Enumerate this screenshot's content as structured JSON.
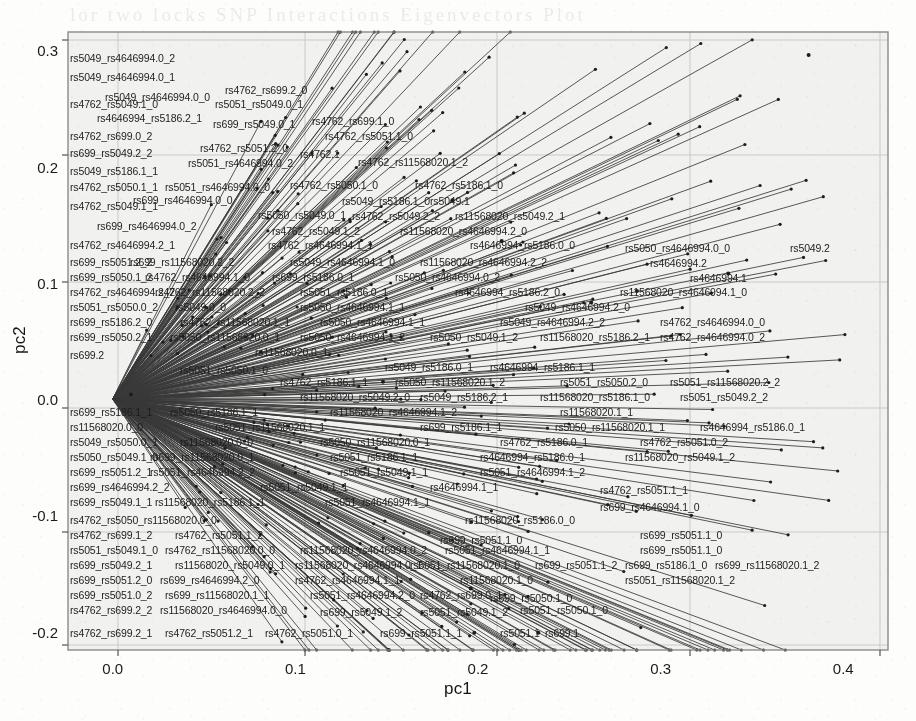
{
  "figure": {
    "kind": "pca-biplot",
    "background_hex": "#fdfdfc",
    "ink_hex": "#1d1d1d",
    "plot_area_hex": "#f2f2f0",
    "frame_hex": "#8c8c8c",
    "grid_hex": "#c8c8c6"
  },
  "chart_data": {
    "type": "scatter",
    "title": "",
    "subtitle": "",
    "xlabel": "pc1",
    "ylabel": "pc2",
    "xlim": [
      -0.0245,
      0.4245
    ],
    "ylim": [
      -0.2158,
      0.3158
    ],
    "xticks": [
      0.0,
      0.1,
      0.2,
      0.3,
      0.4
    ],
    "xticklabels": [
      "0.0",
      "0.1",
      "0.2",
      "0.3",
      "0.4"
    ],
    "yticks": [
      -0.2,
      -0.1,
      0.0,
      0.1,
      0.2,
      0.3
    ],
    "yticklabels": [
      "-0.2",
      "-0.1",
      "0.0",
      "0.1",
      "0.2",
      "0.3"
    ],
    "grid": true,
    "grid_axes": "both",
    "legend": null,
    "legend_position": "none",
    "origin": [
      0.0,
      0.0
    ],
    "marker": {
      "shape": "point",
      "size_px": 2.2,
      "color": "#1d1d1d"
    },
    "series": [
      {
        "name": "loadings",
        "marker_count": 384,
        "points": [
          {
            "label": "rs11568020.2",
            "x": 0.381,
            "y": 0.296
          },
          {
            "label": "rs5049.2",
            "x": 0.337,
            "y": 0.108
          },
          {
            "label": "rs4646994.2",
            "x": 0.287,
            "y": 0.093
          },
          {
            "label": "rs4646994.1",
            "x": 0.262,
            "y": 0.083
          },
          {
            "label": "rs4762.1",
            "x": 0.186,
            "y": 0.171
          },
          {
            "label": "rs5049.1",
            "x": 0.213,
            "y": 0.136
          },
          {
            "label": "rs5186.1_1",
            "x": 0.148,
            "y": 0.015
          },
          {
            "label": "rs5051.1",
            "x": 0.198,
            "y": -0.201
          },
          {
            "label": "rs699.1",
            "x": 0.233,
            "y": -0.201
          },
          {
            "label": "rs699.2",
            "x": 0.01,
            "y": 0.004
          },
          {
            "label": "rs5050.1_0",
            "x": 0.196,
            "y": -0.163
          }
        ]
      }
    ]
  },
  "labels": [
    {
      "t": "rs5049_rs4646994.0_2",
      "x": 70,
      "y": 58,
      "a": "start"
    },
    {
      "t": "rs5049_rs4646994.0_1",
      "x": 70,
      "y": 77,
      "a": "start"
    },
    {
      "t": "rs5049_rs4646994.0_0",
      "x": 105,
      "y": 97,
      "a": "start"
    },
    {
      "t": "rs4762_rs699.2_0",
      "x": 225,
      "y": 90,
      "a": "start"
    },
    {
      "t": "rs4762_rs5049.1_0",
      "x": 70,
      "y": 104,
      "a": "start"
    },
    {
      "t": "rs5051_rs5049.0_1",
      "x": 215,
      "y": 104,
      "a": "start"
    },
    {
      "t": "rs4646994_rs5186.2_1",
      "x": 97,
      "y": 118,
      "a": "start"
    },
    {
      "t": "rs699_rs5049.0_1",
      "x": 213,
      "y": 124,
      "a": "start"
    },
    {
      "t": "rs4762_rs699.1_0",
      "x": 312,
      "y": 121,
      "a": "start"
    },
    {
      "t": "rs4762_rs699.0_2",
      "x": 70,
      "y": 136,
      "a": "start"
    },
    {
      "t": "rs4762_rs5051.1_0",
      "x": 325,
      "y": 136,
      "a": "start"
    },
    {
      "t": "rs699_rs5049.2_2",
      "x": 70,
      "y": 153,
      "a": "start"
    },
    {
      "t": "rs4762_rs5051.2_0",
      "x": 200,
      "y": 148,
      "a": "start"
    },
    {
      "t": "rs4762.1",
      "x": 300,
      "y": 154,
      "a": "start"
    },
    {
      "t": "rs5051_rs4646994.0_2",
      "x": 188,
      "y": 163,
      "a": "start"
    },
    {
      "t": "rs4762_rs11568020.1_2",
      "x": 358,
      "y": 162,
      "a": "start"
    },
    {
      "t": "rs5049_rs5186.1_1",
      "x": 70,
      "y": 171,
      "a": "start"
    },
    {
      "t": "rs4762_rs5050.1_1",
      "x": 70,
      "y": 187,
      "a": "start"
    },
    {
      "t": "rs5051_rs4646994.0_0",
      "x": 165,
      "y": 187,
      "a": "start"
    },
    {
      "t": "rs4762_rs5050.1_0",
      "x": 290,
      "y": 185,
      "a": "start"
    },
    {
      "t": "rs4762_rs5186.1_0",
      "x": 415,
      "y": 185,
      "a": "start"
    },
    {
      "t": "rs699_rs4646994.0_0",
      "x": 133,
      "y": 200,
      "a": "start"
    },
    {
      "t": "rs5049_rs5186.1_0",
      "x": 342,
      "y": 201,
      "a": "start"
    },
    {
      "t": "rs5049.1",
      "x": 430,
      "y": 201,
      "a": "start"
    },
    {
      "t": "rs4762_rs5049.1_1",
      "x": 70,
      "y": 206,
      "a": "start"
    },
    {
      "t": "rs5050_rs5049.0_1",
      "x": 258,
      "y": 215,
      "a": "start"
    },
    {
      "t": "rs4762_rs5049.2_2",
      "x": 352,
      "y": 216,
      "a": "start"
    },
    {
      "t": "rs11568020_rs5049.2_1",
      "x": 455,
      "y": 216,
      "a": "start"
    },
    {
      "t": "rs699_rs4646994.0_2",
      "x": 97,
      "y": 226,
      "a": "start"
    },
    {
      "t": "rs4762_rs5049.1_2",
      "x": 272,
      "y": 231,
      "a": "start"
    },
    {
      "t": "rs11568020_rs4646994.2_0",
      "x": 400,
      "y": 231,
      "a": "start"
    },
    {
      "t": "rs4762_rs4646994.2_1",
      "x": 70,
      "y": 245,
      "a": "start"
    },
    {
      "t": "rs4762_rs4646994.1_1",
      "x": 268,
      "y": 245,
      "a": "start"
    },
    {
      "t": "rs4646994_rs5186.0_0",
      "x": 470,
      "y": 245,
      "a": "start"
    },
    {
      "t": "rs5050_rs4646994.0_0",
      "x": 625,
      "y": 248,
      "a": "start"
    },
    {
      "t": "rs5049.2",
      "x": 790,
      "y": 248,
      "a": "start"
    },
    {
      "t": "rs699_rs5051.2_2",
      "x": 70,
      "y": 262,
      "a": "start"
    },
    {
      "t": "rs699_rs11568020.2_2",
      "x": 130,
      "y": 262,
      "a": "start"
    },
    {
      "t": "rs5049_rs4646994.1_0",
      "x": 290,
      "y": 262,
      "a": "start"
    },
    {
      "t": "rs11568020_rs4646994.2_2",
      "x": 420,
      "y": 262,
      "a": "start"
    },
    {
      "t": "rs4646994.2",
      "x": 650,
      "y": 263,
      "a": "start"
    },
    {
      "t": "rs699_rs5050.1_2",
      "x": 70,
      "y": 277,
      "a": "start"
    },
    {
      "t": "rs4762_rs4646994.1_0",
      "x": 145,
      "y": 277,
      "a": "start"
    },
    {
      "t": "rs699_rs5186.0_1",
      "x": 272,
      "y": 277,
      "a": "start"
    },
    {
      "t": "rs5050_rs4646994.0_2",
      "x": 395,
      "y": 277,
      "a": "start"
    },
    {
      "t": "rs4646994.1",
      "x": 690,
      "y": 278,
      "a": "start"
    },
    {
      "t": "rs4762_rs4646994.2_2",
      "x": 70,
      "y": 292,
      "a": "start"
    },
    {
      "t": "rs4762_rs11568020.2_2",
      "x": 155,
      "y": 292,
      "a": "start"
    },
    {
      "t": "rs5051_rs5186.0_1",
      "x": 300,
      "y": 292,
      "a": "start"
    },
    {
      "t": "rs4646994_rs5186.2_0",
      "x": 455,
      "y": 292,
      "a": "start"
    },
    {
      "t": "rs11568020_rs4646994.1_0",
      "x": 620,
      "y": 292,
      "a": "start"
    },
    {
      "t": "rs5051_rs5050.0_2",
      "x": 70,
      "y": 307,
      "a": "start"
    },
    {
      "t": "rs5049.0_0",
      "x": 175,
      "y": 307,
      "a": "start"
    },
    {
      "t": "rs5050_rs4646994.1_1",
      "x": 300,
      "y": 307,
      "a": "start"
    },
    {
      "t": "rs5049_rs4646994.2_0",
      "x": 525,
      "y": 307,
      "a": "start"
    },
    {
      "t": "rs699_rs5186.2_0",
      "x": 70,
      "y": 322,
      "a": "start"
    },
    {
      "t": "rs4762_rs11568020.1_1",
      "x": 180,
      "y": 322,
      "a": "start"
    },
    {
      "t": "rs5050_rs4646994.1_1",
      "x": 320,
      "y": 322,
      "a": "start"
    },
    {
      "t": "rs5049_rs4646994.2_2",
      "x": 500,
      "y": 322,
      "a": "start"
    },
    {
      "t": "rs4762_rs4646994.0_0",
      "x": 660,
      "y": 322,
      "a": "start"
    },
    {
      "t": "rs699_rs5050.2_1",
      "x": 70,
      "y": 337,
      "a": "start"
    },
    {
      "t": "rs5050_rs11568020.0_1",
      "x": 170,
      "y": 337,
      "a": "start"
    },
    {
      "t": "rs5050_rs4646994.1_2",
      "x": 300,
      "y": 337,
      "a": "start"
    },
    {
      "t": "rs5050_rs5049.1_2",
      "x": 430,
      "y": 337,
      "a": "start"
    },
    {
      "t": "rs11568020_rs5186.2_1",
      "x": 540,
      "y": 337,
      "a": "start"
    },
    {
      "t": "rs4762_rs4646994.0_2",
      "x": 660,
      "y": 337,
      "a": "start"
    },
    {
      "t": "rs699.2",
      "x": 70,
      "y": 355,
      "a": "start"
    },
    {
      "t": "rs11568020.0_1",
      "x": 255,
      "y": 352,
      "a": "start"
    },
    {
      "t": "rs5049_rs5186.0_1",
      "x": 385,
      "y": 367,
      "a": "start"
    },
    {
      "t": "rs4646994_rs5186.1_1",
      "x": 490,
      "y": 367,
      "a": "start"
    },
    {
      "t": "rs5051_rs5050.1_0",
      "x": 180,
      "y": 370,
      "a": "start"
    },
    {
      "t": "rs4762_rs5186.1_1",
      "x": 280,
      "y": 382,
      "a": "start"
    },
    {
      "t": "rs5050_rs11568020.1_2",
      "x": 395,
      "y": 382,
      "a": "start"
    },
    {
      "t": "rs5051_rs5050.2_0",
      "x": 560,
      "y": 382,
      "a": "start"
    },
    {
      "t": "rs5051_rs11568020.2_2",
      "x": 670,
      "y": 382,
      "a": "start"
    },
    {
      "t": "rs11568020_rs5049.2_0",
      "x": 300,
      "y": 397,
      "a": "start"
    },
    {
      "t": "rs5049_rs5186.2_1",
      "x": 420,
      "y": 397,
      "a": "start"
    },
    {
      "t": "rs11568020_rs5186.1_0",
      "x": 540,
      "y": 397,
      "a": "start"
    },
    {
      "t": "rs5051_rs5049.2_2",
      "x": 680,
      "y": 397,
      "a": "start"
    },
    {
      "t": "rs699_rs5186.1_1",
      "x": 70,
      "y": 412,
      "a": "start"
    },
    {
      "t": "rs5050_rs5186.1_1",
      "x": 170,
      "y": 412,
      "a": "start"
    },
    {
      "t": "rs11568020_rs4646994.1_2",
      "x": 330,
      "y": 412,
      "a": "start"
    },
    {
      "t": "rs11568020.1_1",
      "x": 560,
      "y": 412,
      "a": "start"
    },
    {
      "t": "rs11568020.0_0",
      "x": 70,
      "y": 427,
      "a": "start"
    },
    {
      "t": "rs5051_rs11568020.1_1",
      "x": 215,
      "y": 427,
      "a": "start"
    },
    {
      "t": "rs699_rs5186.1_1",
      "x": 420,
      "y": 427,
      "a": "start"
    },
    {
      "t": "rs5050_rs11568020.1_1",
      "x": 555,
      "y": 427,
      "a": "start"
    },
    {
      "t": "rs4646994_rs5186.0_1",
      "x": 700,
      "y": 427,
      "a": "start"
    },
    {
      "t": "rs5049_rs5050.0_1",
      "x": 70,
      "y": 442,
      "a": "start"
    },
    {
      "t": "rs11568020.0_0",
      "x": 180,
      "y": 442,
      "a": "start"
    },
    {
      "t": "rs5050_rs11568020.0_1",
      "x": 320,
      "y": 442,
      "a": "start"
    },
    {
      "t": "rs4762_rs5186.0_1",
      "x": 500,
      "y": 442,
      "a": "start"
    },
    {
      "t": "rs4762_rs5051.0_2",
      "x": 640,
      "y": 442,
      "a": "start"
    },
    {
      "t": "rs5050_rs5049.1_0",
      "x": 70,
      "y": 457,
      "a": "start"
    },
    {
      "t": "rs699_rs11568020.0_1",
      "x": 150,
      "y": 457,
      "a": "start"
    },
    {
      "t": "rs5051_rs5186.1_1",
      "x": 330,
      "y": 457,
      "a": "start"
    },
    {
      "t": "rs4646994_rs5186.0_1",
      "x": 480,
      "y": 457,
      "a": "start"
    },
    {
      "t": "rs11568020_rs5049.1_2",
      "x": 625,
      "y": 457,
      "a": "start"
    },
    {
      "t": "rs699_rs5051.2_1",
      "x": 70,
      "y": 472,
      "a": "start"
    },
    {
      "t": "rs5051_rs4646994.2_2",
      "x": 150,
      "y": 472,
      "a": "start"
    },
    {
      "t": "rs5051_rs5049.1_1",
      "x": 340,
      "y": 472,
      "a": "start"
    },
    {
      "t": "rs5051_rs4646994.1_2",
      "x": 480,
      "y": 472,
      "a": "start"
    },
    {
      "t": "rs699_rs4646994.2_2",
      "x": 70,
      "y": 487,
      "a": "start"
    },
    {
      "t": "rs5051_rs5049.1_1",
      "x": 260,
      "y": 487,
      "a": "start"
    },
    {
      "t": "rs4646994.1_1",
      "x": 430,
      "y": 487,
      "a": "start"
    },
    {
      "t": "rs4762_rs5051.1_1",
      "x": 600,
      "y": 490,
      "a": "start"
    },
    {
      "t": "rs699_rs5049.1_1",
      "x": 70,
      "y": 502,
      "a": "start"
    },
    {
      "t": "rs11568020_rs5186.1_1",
      "x": 155,
      "y": 502,
      "a": "start"
    },
    {
      "t": "rs5051_rs4646994.1_1",
      "x": 325,
      "y": 502,
      "a": "start"
    },
    {
      "t": "rs699_rs4646994.1_0",
      "x": 600,
      "y": 507,
      "a": "start"
    },
    {
      "t": "rs4762_rs5050_rs11568020.0_0",
      "x": 70,
      "y": 520,
      "a": "start"
    },
    {
      "t": "rs11568020_rs5186.0_0",
      "x": 465,
      "y": 520,
      "a": "start"
    },
    {
      "t": "rs4762_rs699.1_2",
      "x": 70,
      "y": 535,
      "a": "start"
    },
    {
      "t": "rs4762_rs5051.1_2",
      "x": 175,
      "y": 535,
      "a": "start"
    },
    {
      "t": "rs699_rs5051.1_0",
      "x": 440,
      "y": 540,
      "a": "start"
    },
    {
      "t": "rs699_rs5051.1_0",
      "x": 640,
      "y": 535,
      "a": "start"
    },
    {
      "t": "rs5051_rs5049.1_0",
      "x": 70,
      "y": 550,
      "a": "start"
    },
    {
      "t": "rs4762_rs11568020.0_0",
      "x": 165,
      "y": 550,
      "a": "start"
    },
    {
      "t": "rs11568020_rs4646994.0_2",
      "x": 300,
      "y": 550,
      "a": "start"
    },
    {
      "t": "rs5051_rs4646994.1_1",
      "x": 445,
      "y": 550,
      "a": "start"
    },
    {
      "t": "rs699_rs5051.1_0",
      "x": 640,
      "y": 550,
      "a": "start"
    },
    {
      "t": "rs699_rs5049.2_1",
      "x": 70,
      "y": 565,
      "a": "start"
    },
    {
      "t": "rs11568020_rs5049.0_1",
      "x": 175,
      "y": 565,
      "a": "start"
    },
    {
      "t": "rs11568020_rs4646994.0_1",
      "x": 295,
      "y": 565,
      "a": "start"
    },
    {
      "t": "rs5051_rs11568020.1_0",
      "x": 410,
      "y": 565,
      "a": "start"
    },
    {
      "t": "rs699_rs5051.1_2",
      "x": 535,
      "y": 565,
      "a": "start"
    },
    {
      "t": "rs699_rs5186.1_0",
      "x": 625,
      "y": 565,
      "a": "start"
    },
    {
      "t": "rs699_rs11568020.1_2",
      "x": 715,
      "y": 565,
      "a": "start"
    },
    {
      "t": "rs699_rs5051.2_0",
      "x": 70,
      "y": 580,
      "a": "start"
    },
    {
      "t": "rs699_rs4646994.2_0",
      "x": 160,
      "y": 580,
      "a": "start"
    },
    {
      "t": "rs4762_rs4646994.1_1",
      "x": 295,
      "y": 580,
      "a": "start"
    },
    {
      "t": "rs11568020.1_0",
      "x": 460,
      "y": 580,
      "a": "start"
    },
    {
      "t": "rs5051_rs11568020.1_2",
      "x": 625,
      "y": 580,
      "a": "start"
    },
    {
      "t": "rs699_rs5051.0_2",
      "x": 70,
      "y": 595,
      "a": "start"
    },
    {
      "t": "rs699_rs11568020.1_1",
      "x": 165,
      "y": 595,
      "a": "start"
    },
    {
      "t": "rs5051_rs4646994.2_0",
      "x": 310,
      "y": 595,
      "a": "start"
    },
    {
      "t": "rs4762_rs699.0_1",
      "x": 420,
      "y": 595,
      "a": "start"
    },
    {
      "t": "rs699_rs5050.1_0",
      "x": 490,
      "y": 598,
      "a": "start"
    },
    {
      "t": "rs4762_rs699.2_2",
      "x": 70,
      "y": 610,
      "a": "start"
    },
    {
      "t": "rs11568020_rs4646994.0_0",
      "x": 160,
      "y": 610,
      "a": "start"
    },
    {
      "t": "rs699_rs5049.1_2",
      "x": 320,
      "y": 612,
      "a": "start"
    },
    {
      "t": "rs5051_rs5049.1_2",
      "x": 420,
      "y": 612,
      "a": "start"
    },
    {
      "t": "rs5051_rs5050.1_0",
      "x": 520,
      "y": 610,
      "a": "start"
    },
    {
      "t": "rs4762_rs699.2_1",
      "x": 70,
      "y": 633,
      "a": "start"
    },
    {
      "t": "rs4762_rs5051.2_1",
      "x": 165,
      "y": 633,
      "a": "start"
    },
    {
      "t": "rs4762_rs5051.0_1",
      "x": 265,
      "y": 633,
      "a": "start"
    },
    {
      "t": "rs699_rs5051.1_1",
      "x": 380,
      "y": 633,
      "a": "start"
    },
    {
      "t": "rs5051.1",
      "x": 500,
      "y": 633,
      "a": "start"
    },
    {
      "t": "rs699.1",
      "x": 545,
      "y": 633,
      "a": "start"
    }
  ],
  "ghost_text": "lor two locks SNP Interactions Eigenvectors Plot"
}
